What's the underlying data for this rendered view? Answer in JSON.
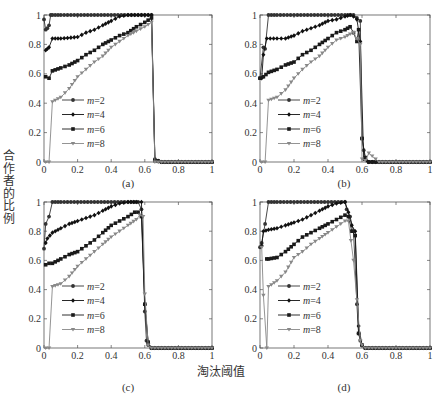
{
  "figure": {
    "ylabel": "合作者的比例",
    "xlabel": "淘汰阈值"
  },
  "chart_data": [
    {
      "type": "line",
      "panel": "(a)",
      "xlim": [
        0,
        1
      ],
      "ylim": [
        0,
        1
      ],
      "xticks": [
        "0",
        "0.2",
        "0.4",
        "0.6",
        "0.8",
        "1"
      ],
      "yticks": [
        "0",
        "0.2",
        "0.4",
        "0.6",
        "0.8",
        "1"
      ],
      "legend": [
        "m=2",
        "m=4",
        "m=6",
        "m=8"
      ],
      "legend_position": "lower-left",
      "grid": false,
      "drop_x": 0.65,
      "series": [
        {
          "name": "m=2",
          "marker": "circle",
          "x": [
            0,
            0.01,
            0.02,
            0.03,
            0.04,
            0.05,
            0.1,
            0.2,
            0.3,
            0.4,
            0.5,
            0.6,
            0.64,
            0.66,
            0.7,
            0.8,
            0.9,
            1.0
          ],
          "y": [
            0.97,
            0.9,
            0.91,
            0.93,
            1.0,
            1.0,
            1.0,
            1.0,
            1.0,
            1.0,
            1.0,
            1.0,
            1.0,
            0.02,
            0.0,
            0.0,
            0.0,
            0.0
          ]
        },
        {
          "name": "m=4",
          "marker": "diamond",
          "x": [
            0.01,
            0.02,
            0.03,
            0.05,
            0.1,
            0.2,
            0.25,
            0.3,
            0.35,
            0.4,
            0.45,
            0.5,
            0.6,
            0.64,
            0.66,
            0.7,
            0.8,
            0.9,
            1.0
          ],
          "y": [
            0.76,
            0.77,
            0.78,
            0.84,
            0.84,
            0.85,
            0.88,
            0.9,
            0.93,
            0.96,
            0.99,
            1.0,
            1.0,
            1.0,
            0.01,
            0.0,
            0.0,
            0.0,
            0.0
          ]
        },
        {
          "name": "m=6",
          "marker": "square",
          "x": [
            0.01,
            0.03,
            0.05,
            0.1,
            0.15,
            0.2,
            0.25,
            0.3,
            0.35,
            0.4,
            0.45,
            0.5,
            0.55,
            0.6,
            0.64,
            0.66,
            0.7,
            0.8,
            0.9,
            1.0
          ],
          "y": [
            0.58,
            0.57,
            0.62,
            0.64,
            0.66,
            0.69,
            0.73,
            0.76,
            0.8,
            0.83,
            0.86,
            0.88,
            0.92,
            0.95,
            0.98,
            0.01,
            0.0,
            0.0,
            0.0,
            0.0
          ]
        },
        {
          "name": "m=8",
          "marker": "triangle-down",
          "x": [
            0.01,
            0.03,
            0.05,
            0.1,
            0.15,
            0.2,
            0.25,
            0.3,
            0.35,
            0.4,
            0.45,
            0.5,
            0.55,
            0.6,
            0.64,
            0.66,
            0.7,
            0.8,
            0.9,
            1.0
          ],
          "y": [
            0.0,
            0.0,
            0.41,
            0.44,
            0.5,
            0.58,
            0.63,
            0.68,
            0.72,
            0.78,
            0.82,
            0.86,
            0.89,
            0.92,
            0.95,
            0.0,
            0.0,
            0.0,
            0.0,
            0.0
          ]
        }
      ]
    },
    {
      "type": "line",
      "panel": "(b)",
      "xlim": [
        0,
        1
      ],
      "ylim": [
        0,
        1
      ],
      "xticks": [
        "0",
        "0.2",
        "0.4",
        "0.6",
        "0.8",
        "1"
      ],
      "yticks": [
        "0",
        "0.2",
        "0.4",
        "0.6",
        "0.8",
        "1"
      ],
      "legend": [
        "m=2",
        "m=4",
        "m=6",
        "m=8"
      ],
      "legend_position": "lower-left",
      "grid": false,
      "series": [
        {
          "name": "m=2",
          "marker": "circle",
          "x": [
            0,
            0.02,
            0.03,
            0.05,
            0.1,
            0.2,
            0.3,
            0.4,
            0.5,
            0.55,
            0.57,
            0.59,
            0.6,
            0.61,
            0.62,
            0.64,
            0.7,
            0.8,
            0.9,
            1.0
          ],
          "y": [
            0.57,
            0.78,
            0.77,
            1.0,
            1.0,
            1.0,
            1.0,
            1.0,
            1.0,
            1.0,
            0.98,
            0.96,
            0.16,
            0.08,
            0.02,
            0.0,
            0.0,
            0.0,
            0.0,
            0.0
          ]
        },
        {
          "name": "m=4",
          "marker": "diamond",
          "x": [
            0.01,
            0.02,
            0.04,
            0.1,
            0.15,
            0.2,
            0.25,
            0.3,
            0.35,
            0.4,
            0.45,
            0.5,
            0.53,
            0.55,
            0.57,
            0.59,
            0.61,
            0.64,
            0.7,
            0.8,
            0.9,
            1.0
          ],
          "y": [
            0.57,
            0.73,
            0.84,
            0.84,
            0.84,
            0.86,
            0.89,
            0.91,
            0.93,
            0.96,
            0.97,
            0.99,
            1.0,
            0.99,
            0.97,
            0.82,
            0.02,
            0.0,
            0.0,
            0.0,
            0.0,
            0.0
          ]
        },
        {
          "name": "m=6",
          "marker": "square",
          "x": [
            0,
            0.02,
            0.05,
            0.1,
            0.15,
            0.2,
            0.25,
            0.3,
            0.35,
            0.4,
            0.45,
            0.5,
            0.53,
            0.55,
            0.57,
            0.58,
            0.6,
            0.62,
            0.64,
            0.7,
            0.8,
            0.9,
            1.0
          ],
          "y": [
            0.57,
            0.58,
            0.61,
            0.63,
            0.66,
            0.68,
            0.73,
            0.76,
            0.8,
            0.84,
            0.88,
            0.9,
            0.92,
            0.88,
            0.82,
            0.9,
            0.16,
            0.03,
            0.0,
            0.0,
            0.0,
            0.0,
            0.0
          ]
        },
        {
          "name": "m=8",
          "marker": "triangle-down",
          "x": [
            0.01,
            0.03,
            0.05,
            0.1,
            0.15,
            0.2,
            0.25,
            0.3,
            0.35,
            0.4,
            0.45,
            0.5,
            0.53,
            0.55,
            0.57,
            0.59,
            0.6,
            0.62,
            0.64,
            0.7,
            0.8,
            0.9,
            1.0
          ],
          "y": [
            0.0,
            0.0,
            0.42,
            0.44,
            0.49,
            0.57,
            0.63,
            0.68,
            0.72,
            0.78,
            0.83,
            0.85,
            0.87,
            0.88,
            0.84,
            0.8,
            0.02,
            0.01,
            0.06,
            0.0,
            0.0,
            0.0,
            0.0
          ]
        }
      ]
    },
    {
      "type": "line",
      "panel": "(c)",
      "xlim": [
        0,
        1
      ],
      "ylim": [
        0,
        1
      ],
      "xticks": [
        "0",
        "0.2",
        "0.4",
        "0.6",
        "0.8",
        "1"
      ],
      "yticks": [
        "0",
        "0.2",
        "0.4",
        "0.6",
        "0.8",
        "1"
      ],
      "legend": [
        "m=2",
        "m=4",
        "m=6",
        "m=8"
      ],
      "legend_position": "lower-left",
      "grid": false,
      "series": [
        {
          "name": "m=2",
          "marker": "circle",
          "x": [
            0,
            0.01,
            0.03,
            0.05,
            0.1,
            0.2,
            0.3,
            0.4,
            0.5,
            0.56,
            0.58,
            0.6,
            0.61,
            0.62,
            0.64,
            0.7,
            0.8,
            0.9,
            1.0
          ],
          "y": [
            0.68,
            0.85,
            0.9,
            1.0,
            1.0,
            1.0,
            1.0,
            1.0,
            1.0,
            1.0,
            0.95,
            0.25,
            0.05,
            0.02,
            0.0,
            0.0,
            0.0,
            0.0,
            0.0
          ]
        },
        {
          "name": "m=4",
          "marker": "diamond",
          "x": [
            0.01,
            0.02,
            0.05,
            0.1,
            0.15,
            0.2,
            0.25,
            0.3,
            0.35,
            0.4,
            0.45,
            0.5,
            0.55,
            0.58,
            0.6,
            0.62,
            0.64,
            0.7,
            0.8,
            0.9,
            1.0
          ],
          "y": [
            0.72,
            0.75,
            0.79,
            0.82,
            0.85,
            0.87,
            0.89,
            0.91,
            0.94,
            0.97,
            0.99,
            1.0,
            1.0,
            1.0,
            0.3,
            0.03,
            0.0,
            0.0,
            0.0,
            0.0,
            0.0
          ]
        },
        {
          "name": "m=6",
          "marker": "square",
          "x": [
            0.01,
            0.03,
            0.05,
            0.1,
            0.15,
            0.2,
            0.25,
            0.3,
            0.35,
            0.4,
            0.45,
            0.5,
            0.54,
            0.56,
            0.58,
            0.6,
            0.62,
            0.64,
            0.7,
            0.8,
            0.9,
            1.0
          ],
          "y": [
            0.57,
            0.58,
            0.58,
            0.61,
            0.64,
            0.66,
            0.7,
            0.74,
            0.79,
            0.84,
            0.87,
            0.9,
            0.93,
            0.93,
            0.9,
            0.3,
            0.04,
            0.0,
            0.0,
            0.0,
            0.0,
            0.0
          ]
        },
        {
          "name": "m=8",
          "marker": "triangle-down",
          "x": [
            0.01,
            0.03,
            0.05,
            0.1,
            0.15,
            0.2,
            0.25,
            0.3,
            0.35,
            0.4,
            0.45,
            0.5,
            0.55,
            0.57,
            0.59,
            0.6,
            0.62,
            0.64,
            0.7,
            0.8,
            0.9,
            1.0
          ],
          "y": [
            0.0,
            0.0,
            0.42,
            0.44,
            0.49,
            0.56,
            0.61,
            0.66,
            0.71,
            0.76,
            0.8,
            0.84,
            0.88,
            0.91,
            0.9,
            0.37,
            0.02,
            0.0,
            0.0,
            0.0,
            0.0,
            0.0
          ]
        }
      ]
    },
    {
      "type": "line",
      "panel": "(d)",
      "xlim": [
        0,
        1
      ],
      "ylim": [
        0,
        1
      ],
      "xticks": [
        "0",
        "0.2",
        "0.4",
        "0.6",
        "0.8",
        "1"
      ],
      "yticks": [
        "0",
        "0.2",
        "0.4",
        "0.6",
        "0.8",
        "1"
      ],
      "legend": [
        "m=2",
        "m=4",
        "m=6",
        "m=8"
      ],
      "legend_position": "lower-left",
      "grid": false,
      "series": [
        {
          "name": "m=2",
          "marker": "circle",
          "x": [
            0,
            0.01,
            0.03,
            0.05,
            0.1,
            0.2,
            0.3,
            0.4,
            0.5,
            0.51,
            0.53,
            0.55,
            0.57,
            0.58,
            0.59,
            0.6,
            0.62,
            0.64,
            0.7,
            0.8,
            0.9,
            1.0
          ],
          "y": [
            0.69,
            0.72,
            0.85,
            1.0,
            1.0,
            1.0,
            1.0,
            1.0,
            1.0,
            0.95,
            0.9,
            0.8,
            0.3,
            0.1,
            0.05,
            0.02,
            0.0,
            0.0,
            0.0,
            0.0,
            0.0,
            0.0
          ]
        },
        {
          "name": "m=4",
          "marker": "diamond",
          "x": [
            0.01,
            0.02,
            0.05,
            0.1,
            0.15,
            0.2,
            0.25,
            0.3,
            0.35,
            0.4,
            0.45,
            0.5,
            0.52,
            0.54,
            0.56,
            0.58,
            0.6,
            0.62,
            0.64,
            0.7,
            0.8,
            0.9,
            1.0
          ],
          "y": [
            0.7,
            0.8,
            0.81,
            0.82,
            0.84,
            0.86,
            0.88,
            0.91,
            0.94,
            0.97,
            0.99,
            1.0,
            0.93,
            0.84,
            0.8,
            0.15,
            0.02,
            0.0,
            0.0,
            0.0,
            0.0,
            0.0,
            0.0
          ]
        },
        {
          "name": "m=6",
          "marker": "square",
          "x": [
            0.04,
            0.05,
            0.1,
            0.15,
            0.2,
            0.25,
            0.3,
            0.35,
            0.4,
            0.45,
            0.5,
            0.52,
            0.54,
            0.56,
            0.58,
            0.6,
            0.62,
            0.64,
            0.7,
            0.8,
            0.9,
            1.0
          ],
          "y": [
            0.61,
            0.61,
            0.62,
            0.66,
            0.71,
            0.76,
            0.79,
            0.82,
            0.85,
            0.88,
            0.91,
            0.9,
            0.8,
            0.77,
            0.1,
            0.02,
            0.0,
            0.0,
            0.0,
            0.0,
            0.0,
            0.0
          ]
        },
        {
          "name": "m=8",
          "marker": "triangle-down",
          "x": [
            0.01,
            0.02,
            0.04,
            0.05,
            0.1,
            0.15,
            0.2,
            0.25,
            0.3,
            0.35,
            0.4,
            0.45,
            0.5,
            0.52,
            0.55,
            0.57,
            0.59,
            0.6,
            0.62,
            0.64,
            0.7,
            0.8,
            0.9,
            1.0
          ],
          "y": [
            0.69,
            0.36,
            0.0,
            0.42,
            0.46,
            0.52,
            0.62,
            0.66,
            0.71,
            0.75,
            0.79,
            0.83,
            0.87,
            0.87,
            0.6,
            0.33,
            0.05,
            0.02,
            0.0,
            0.0,
            0.0,
            0.0,
            0.0,
            0.0
          ]
        }
      ]
    }
  ]
}
